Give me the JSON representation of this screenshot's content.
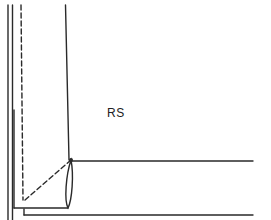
{
  "diagram": {
    "title": "",
    "labels": {
      "right_side": "RS"
    },
    "colors": {
      "stroke": "#2a2a2a",
      "background": "#ffffff"
    }
  }
}
